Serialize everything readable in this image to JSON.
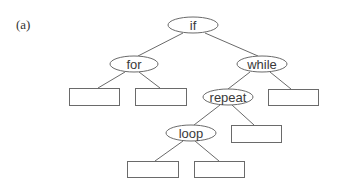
{
  "panel_label": "(a)",
  "colors": {
    "stroke": "#6a6a6a",
    "text": "#3a3a3a",
    "background": "#ffffff"
  },
  "tree": {
    "nodes": [
      {
        "id": "if",
        "label": "if",
        "shape": "ellipse"
      },
      {
        "id": "for",
        "label": "for",
        "shape": "ellipse"
      },
      {
        "id": "while",
        "label": "while",
        "shape": "ellipse"
      },
      {
        "id": "repeat",
        "label": "repeat",
        "shape": "ellipse"
      },
      {
        "id": "loop",
        "label": "loop",
        "shape": "ellipse"
      },
      {
        "id": "box1",
        "label": "",
        "shape": "rect"
      },
      {
        "id": "box2",
        "label": "",
        "shape": "rect"
      },
      {
        "id": "box3",
        "label": "",
        "shape": "rect"
      },
      {
        "id": "box4",
        "label": "",
        "shape": "rect"
      },
      {
        "id": "box5",
        "label": "",
        "shape": "rect"
      },
      {
        "id": "box6",
        "label": "",
        "shape": "rect"
      }
    ],
    "edges": [
      [
        "if",
        "for"
      ],
      [
        "if",
        "while"
      ],
      [
        "for",
        "box1"
      ],
      [
        "for",
        "box2"
      ],
      [
        "while",
        "repeat"
      ],
      [
        "while",
        "box3"
      ],
      [
        "repeat",
        "loop"
      ],
      [
        "repeat",
        "box4"
      ],
      [
        "loop",
        "box5"
      ],
      [
        "loop",
        "box6"
      ]
    ]
  }
}
